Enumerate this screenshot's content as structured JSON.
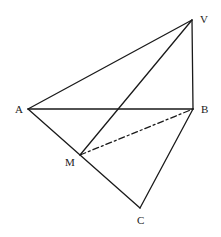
{
  "diagram": {
    "type": "geometric-figure",
    "stroke_color": "#1a1a1a",
    "background": "#ffffff",
    "points": {
      "V": {
        "label": "V",
        "x": 192,
        "y": 20,
        "label_x": 200,
        "label_y": 23
      },
      "A": {
        "label": "A",
        "x": 28,
        "y": 109,
        "label_x": 15,
        "label_y": 113
      },
      "B": {
        "label": "B",
        "x": 193,
        "y": 109,
        "label_x": 201,
        "label_y": 113
      },
      "M": {
        "label": "M",
        "x": 80,
        "y": 155,
        "label_x": 65,
        "label_y": 166
      },
      "C": {
        "label": "C",
        "x": 140,
        "y": 208,
        "label_x": 137,
        "label_y": 224
      }
    },
    "edges": [
      {
        "from": "V",
        "to": "A",
        "style": "solid"
      },
      {
        "from": "V",
        "to": "B",
        "style": "solid"
      },
      {
        "from": "V",
        "to": "M",
        "style": "solid"
      },
      {
        "from": "A",
        "to": "B",
        "style": "solid"
      },
      {
        "from": "A",
        "to": "C",
        "style": "solid"
      },
      {
        "from": "B",
        "to": "C",
        "style": "solid"
      },
      {
        "from": "M",
        "to": "B",
        "style": "dashed"
      }
    ]
  }
}
